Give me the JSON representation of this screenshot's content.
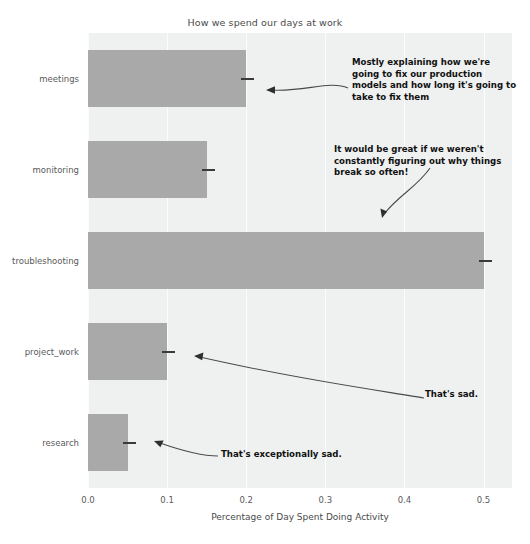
{
  "chart_data": {
    "type": "bar",
    "orientation": "horizontal",
    "title": "How we spend our days at work",
    "xlabel": "Percentage of Day Spent Doing Activity",
    "ylabel": "",
    "categories": [
      "meetings",
      "monitoring",
      "troubleshooting",
      "project_work",
      "research"
    ],
    "values": [
      0.2,
      0.15,
      0.5,
      0.1,
      0.05
    ],
    "xlim": [
      0.0,
      0.536
    ],
    "xticks": [
      "0.0",
      "0.1",
      "0.2",
      "0.3",
      "0.4",
      "0.5"
    ],
    "xtick_values": [
      0.0,
      0.1,
      0.2,
      0.3,
      0.4,
      0.5
    ],
    "grid": "vertical-white",
    "legend": "none",
    "bar_color": "#a9a9a9",
    "plot_background": "#eff0f0",
    "error_marker_color": "#3a3a3a",
    "annotations": [
      {
        "id": "meetings",
        "text": "Mostly explaining how we're\ngoing to fix our production\nmodels and how long it's going to\ntake to fix them",
        "target_category": "meetings"
      },
      {
        "id": "monitoring",
        "text": "It would be great if we weren't\nconstantly figuring out why things\nbreak so often!",
        "target_category": "monitoring"
      },
      {
        "id": "project_work",
        "text": "That's sad.",
        "target_category": "project_work"
      },
      {
        "id": "research",
        "text": "That's exceptionally sad.",
        "target_category": "research"
      }
    ]
  }
}
